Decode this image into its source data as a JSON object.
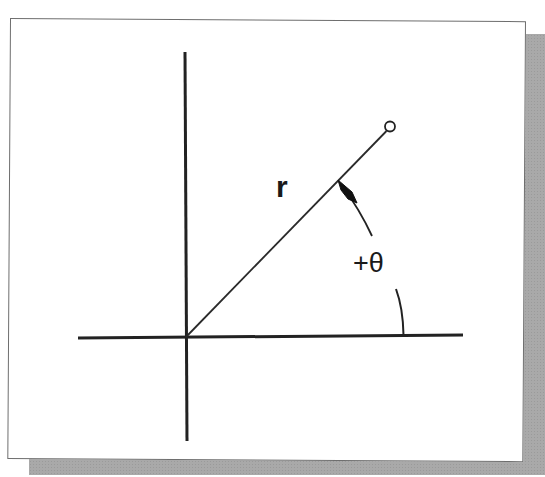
{
  "figure": {
    "labels": {
      "radius": "r",
      "angle": "+θ"
    },
    "colors": {
      "line": "#222222",
      "frame_border": "#6e6e6e",
      "shadow": "#a9a9a9",
      "background": "#ffffff"
    },
    "elements": {
      "horizontal_axis": {
        "x1": 78,
        "y1": 338,
        "x2": 463,
        "y2": 335
      },
      "vertical_axis": {
        "x1": 185,
        "y1": 52,
        "x2": 187,
        "y2": 441
      },
      "origin": {
        "x": 186,
        "y": 337
      },
      "radius_line": {
        "x1": 186,
        "y1": 337,
        "x2": 386,
        "y2": 131
      },
      "endpoint_circle": {
        "cx": 390,
        "cy": 127,
        "r": 5
      },
      "angle_arc_upper": {
        "from": [
          339,
          181
        ],
        "to": [
          372,
          236
        ]
      },
      "angle_arc_lower": {
        "from": [
          396,
          289
        ],
        "to": [
          404,
          335
        ]
      }
    }
  }
}
